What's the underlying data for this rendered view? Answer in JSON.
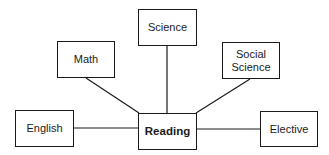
{
  "diagram": {
    "type": "hub-and-spoke",
    "center": {
      "id": "reading",
      "label": "Reading",
      "bold": true
    },
    "nodes": [
      {
        "id": "science",
        "label": "Science"
      },
      {
        "id": "math",
        "label": "Math"
      },
      {
        "id": "social",
        "label": "Social Science"
      },
      {
        "id": "english",
        "label": "English"
      },
      {
        "id": "elective",
        "label": "Elective"
      }
    ],
    "edges": [
      {
        "from": "math",
        "to": "reading"
      },
      {
        "from": "science",
        "to": "reading"
      },
      {
        "from": "social",
        "to": "reading"
      },
      {
        "from": "english",
        "to": "reading"
      },
      {
        "from": "reading",
        "to": "elective"
      }
    ],
    "colors": {
      "stroke": "#1a1a1a",
      "fill": "#ffffff",
      "text": "#1a1a1a"
    }
  }
}
